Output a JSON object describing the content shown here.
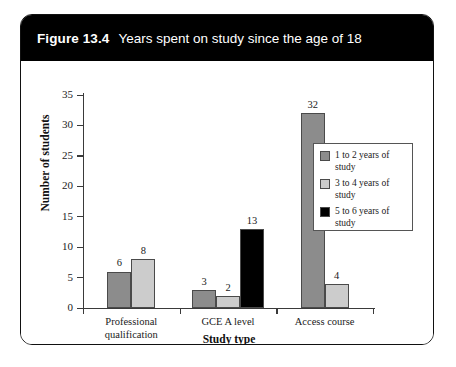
{
  "figure": {
    "label": "Figure 13.4",
    "title": "Years spent on study since the age of 18"
  },
  "chart_data": {
    "type": "bar",
    "title": "Years spent on study since the age of 18",
    "xlabel": "Study type",
    "ylabel": "Number of students",
    "ylim": [
      0,
      35
    ],
    "yticks": [
      0,
      5,
      10,
      15,
      20,
      25,
      30,
      35
    ],
    "grid": false,
    "legend_position": "right",
    "categories": [
      "Professional qualification",
      "GCE A level",
      "Access course"
    ],
    "category_lines": [
      [
        "Professional",
        "qualification"
      ],
      [
        "GCE A level"
      ],
      [
        "Access course"
      ]
    ],
    "series": [
      {
        "name": "1 to 2 years of study",
        "color": "#8c8c8c",
        "values": [
          6,
          3,
          32
        ]
      },
      {
        "name": "3 to 4 years of study",
        "color": "#cccccc",
        "values": [
          8,
          2,
          4
        ]
      },
      {
        "name": "5 to 6 years of study",
        "color": "#000000",
        "values": [
          null,
          13,
          null
        ]
      }
    ]
  },
  "colors": {
    "header_background": "#000000",
    "header_text": "#ffffff",
    "frame_border": "#111111",
    "axis": "#3a3a3a",
    "series_1": "#8c8c8c",
    "series_2": "#cccccc",
    "series_3": "#000000"
  }
}
